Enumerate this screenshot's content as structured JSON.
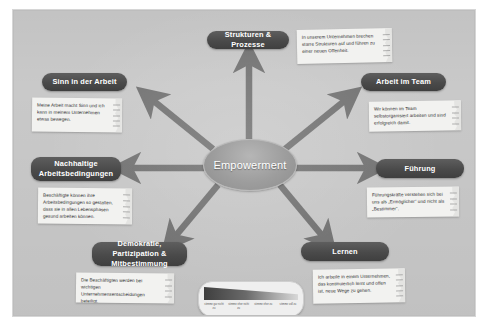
{
  "slide": {
    "center": {
      "label": "Empowerment"
    },
    "branches": [
      {
        "key": "strukturen",
        "label": "Strukturen & Prozesse",
        "note": "In unserem Unternehmen brechen starre Strukturen auf und führen zu einer neuen Offenheit."
      },
      {
        "key": "sinn",
        "label": "Sinn in der Arbeit",
        "note": "Meine Arbeit macht Sinn und ich kann in meinem Unternehmen etwas bewegen."
      },
      {
        "key": "team",
        "label": "Arbeit im Team",
        "note": "Wir können im Team selbstorganisiert arbeiten und sind erfolgreich damit."
      },
      {
        "key": "nachhaltige",
        "label": "Nachhaltige Arbeitsbedingungen",
        "note": "Beschäftigte können ihre Arbeitsbedingungen so gestalten, dass sie in allen Lebensphasen gesund arbeiten können."
      },
      {
        "key": "fuehrung",
        "label": "Führung",
        "note": "Führungskräfte verstehen sich bei uns als „Ermöglicher“ und nicht als „Bestimmer“."
      },
      {
        "key": "demokratie",
        "label": "Demokratie, Partizipation & Mitbestimmung",
        "note": "Die Beschäftigten werden bei wichtigen Unternehmensentscheidungen beteiligt."
      },
      {
        "key": "lernen",
        "label": "Lernen",
        "note": "Ich arbeite in einem Unternehmen, das kontinuierlich lernt und offen ist, neue Wege zu gehen."
      }
    ],
    "scale": {
      "segments": [
        "stimme gar nicht zu",
        "stimme eher nicht zu",
        "stimme eher zu",
        "stimme voll zu"
      ]
    },
    "colors": {
      "background": "#c9c9c9",
      "pill": "#4a4a4a",
      "arrow": "#6f6f6f",
      "center": "#9d9d9d",
      "note": "#f2f2f0"
    }
  }
}
